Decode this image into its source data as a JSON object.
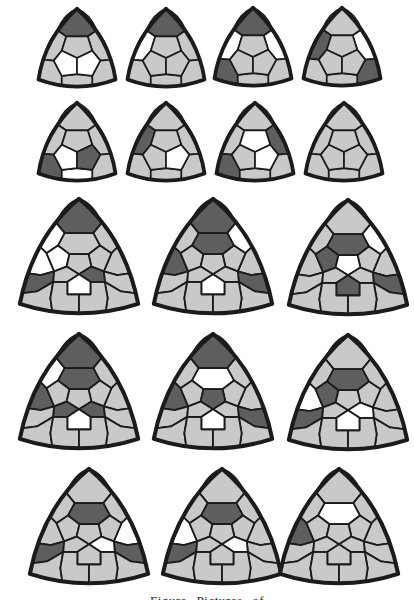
{
  "figure": {
    "background": "#ffffff",
    "colors": {
      "gray": "#c9c9c9",
      "dark": "#5e5e5e",
      "white": "#ffffff",
      "line": "#1b1b1b"
    },
    "caption": {
      "partial_text": "Figure    Pictures of"
    },
    "shapes": [
      {
        "id": "small-1",
        "kind": "small",
        "x": 32,
        "y": 6,
        "cells": {
          "corner-top": "dark",
          "center-bl": "white",
          "center-br": "white"
        }
      },
      {
        "id": "small-2",
        "kind": "small",
        "x": 121,
        "y": 6,
        "cells": {
          "corner-top": "dark",
          "edge-left": "white"
        }
      },
      {
        "id": "small-3",
        "kind": "small",
        "x": 208,
        "y": 5,
        "cells": {
          "corner-top": "dark",
          "edge-left": "white",
          "edge-right": "white",
          "corner-bl": "dark"
        }
      },
      {
        "id": "small-4",
        "kind": "small",
        "x": 297,
        "y": 5,
        "cells": {
          "edge-left": "dark",
          "edge-right": "white",
          "corner-br": "dark"
        }
      },
      {
        "id": "small-5",
        "kind": "small",
        "x": 32,
        "y": 100,
        "cells": {
          "corner-bl": "dark",
          "center-bl": "white",
          "center-br": "dark",
          "edge-bottom": "white"
        }
      },
      {
        "id": "small-6",
        "kind": "small",
        "x": 121,
        "y": 100,
        "cells": {
          "edge-left": "dark",
          "center-br": "white"
        }
      },
      {
        "id": "small-7",
        "kind": "small",
        "x": 210,
        "y": 100,
        "cells": {
          "corner-bl": "dark",
          "edge-right": "dark",
          "center-top": "white",
          "center-br": "white"
        }
      },
      {
        "id": "small-8",
        "kind": "small",
        "x": 299,
        "y": 100,
        "cells": {}
      },
      {
        "id": "large-1",
        "kind": "large",
        "x": 12,
        "y": 195,
        "cells": {
          "corner-top": "dark",
          "flank-left": "white",
          "edge-left-upper": "white",
          "inner-left": "white",
          "edge-left-lower": "dark",
          "hex-bottom": "white",
          "center-br": "dark"
        }
      },
      {
        "id": "large-2",
        "kind": "large",
        "x": 146,
        "y": 195,
        "cells": {
          "corner-top": "dark",
          "edge-left-upper": "dark",
          "hex-top": "dark",
          "flank-right": "white",
          "edge-right-lower": "dark",
          "hex-bottom": "white"
        }
      },
      {
        "id": "large-3",
        "kind": "large",
        "x": 281,
        "y": 196,
        "cells": {
          "hex-top": "dark",
          "inner-left": "dark",
          "flank-right": "white",
          "center": "white",
          "hex-bottom": "dark",
          "edge-right-lower": "dark"
        }
      },
      {
        "id": "large-4",
        "kind": "large",
        "x": 12,
        "y": 330,
        "cells": {
          "corner-top": "dark",
          "flank-left": "white",
          "edge-left-upper": "dark",
          "hex-top": "dark",
          "center-bl": "dark",
          "center-br": "dark",
          "hex-bottom": "white"
        }
      },
      {
        "id": "large-5",
        "kind": "large",
        "x": 146,
        "y": 330,
        "cells": {
          "corner-top": "dark",
          "edge-left-upper": "dark",
          "hex-top": "white",
          "center": "dark",
          "edge-right-lower": "dark",
          "hex-bottom": "white"
        }
      },
      {
        "id": "large-6",
        "kind": "large",
        "x": 281,
        "y": 331,
        "cells": {
          "hex-top": "dark",
          "inner-left": "dark",
          "edge-left-upper": "white",
          "edge-left-lower": "dark",
          "hex-bottom": "white",
          "center-br": "white"
        }
      },
      {
        "id": "large-7",
        "kind": "large",
        "x": 22,
        "y": 465,
        "cells": {
          "hex-top": "dark",
          "edge-right-upper": "white",
          "center-br": "white",
          "edge-left-lower": "dark",
          "edge-right-lower": "dark"
        }
      },
      {
        "id": "large-8",
        "kind": "large",
        "x": 155,
        "y": 465,
        "cells": {
          "hex-top": "dark",
          "edge-left-upper": "white",
          "edge-left-lower": "dark",
          "center-br": "white"
        }
      },
      {
        "id": "large-9",
        "kind": "large",
        "x": 272,
        "y": 465,
        "cells": {
          "hex-top": "white",
          "edge-left-upper": "dark"
        }
      }
    ]
  }
}
